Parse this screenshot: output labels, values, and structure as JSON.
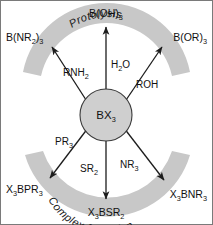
{
  "diagram": {
    "center": {
      "label": "BX",
      "label_sub": "3",
      "fill_color": "#cfcfcf",
      "stroke_color": "#3a3a3a"
    },
    "arcs": [
      {
        "id": "protolysis",
        "label": "Protolysis",
        "position": "top",
        "color": "#c8c8c8"
      },
      {
        "id": "complex-formation",
        "label": "Complex formation",
        "position": "bottom",
        "color": "#c8c8c8"
      }
    ],
    "reactions": [
      {
        "id": "amine-protolysis",
        "reagent": "RNH",
        "reagent_sub": "2",
        "product": "B(NR",
        "product_sub1": "2",
        "product_mid": ")",
        "product_sub2": "3",
        "product_full": "B(NR2)3",
        "direction": "upper-left",
        "group": "protolysis"
      },
      {
        "id": "water-protolysis",
        "reagent": "H",
        "reagent_sub": "2",
        "reagent_tail": "O",
        "product": "B(OH)",
        "product_sub2": "3",
        "product_full": "B(OH)3",
        "direction": "up",
        "group": "protolysis"
      },
      {
        "id": "alcohol-protolysis",
        "reagent": "ROH",
        "reagent_sub": "",
        "product": "B(OR)",
        "product_sub2": "3",
        "product_full": "B(OR)3",
        "direction": "upper-right",
        "group": "protolysis"
      },
      {
        "id": "phosphine-complex",
        "reagent": "PR",
        "reagent_sub": "3",
        "product_pre": "X",
        "product_presub": "3",
        "product": "BPR",
        "product_sub2": "3",
        "product_full": "X3BPR3",
        "direction": "lower-left",
        "group": "complex-formation"
      },
      {
        "id": "sulfide-complex",
        "reagent": "SR",
        "reagent_sub": "2",
        "product_pre": "X",
        "product_presub": "3",
        "product": "BSR",
        "product_sub2": "2",
        "product_full": "X3BSR2",
        "direction": "down",
        "group": "complex-formation"
      },
      {
        "id": "amine-complex",
        "reagent": "NR",
        "reagent_sub": "3",
        "product_pre": "X",
        "product_presub": "3",
        "product": "BNR",
        "product_sub2": "3",
        "product_full": "X3BNR3",
        "direction": "lower-right",
        "group": "complex-formation"
      }
    ],
    "labels": {
      "top_product": "B(OH)",
      "top_product_sub": "3",
      "top_left_product": "B(NR",
      "top_left_product_sub1": "2",
      "top_left_product_close": ")",
      "top_left_product_sub2": "3",
      "top_right_product": "B(OR)",
      "top_right_product_sub": "3",
      "bottom_product_pre": "X",
      "bottom_product_presub": "3",
      "bottom_product": "BSR",
      "bottom_product_sub": "2",
      "bottom_left_product_pre": "X",
      "bottom_left_product_presub": "3",
      "bottom_left_product": "BPR",
      "bottom_left_product_sub": "3",
      "bottom_right_product_pre": "X",
      "bottom_right_product_presub": "3",
      "bottom_right_product": "BNR",
      "bottom_right_product_sub": "3",
      "reagent_rnh2": "RNH",
      "reagent_rnh2_sub": "2",
      "reagent_h2o_pre": "H",
      "reagent_h2o_sub": "2",
      "reagent_h2o_post": "O",
      "reagent_roh": "ROH",
      "reagent_pr3": "PR",
      "reagent_pr3_sub": "3",
      "reagent_sr2": "SR",
      "reagent_sr2_sub": "2",
      "reagent_nr3": "NR",
      "reagent_nr3_sub": "3",
      "arc_top": "Protolysis",
      "arc_bottom": "Complex formation",
      "center_label": "BX",
      "center_label_sub": "3"
    }
  }
}
